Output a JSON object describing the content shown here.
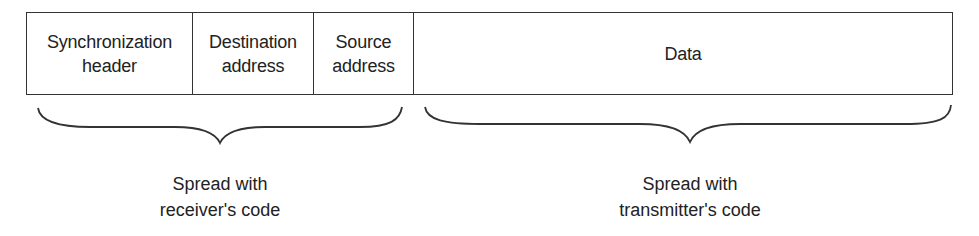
{
  "diagram": {
    "type": "packet-format",
    "fields": [
      {
        "id": "sync",
        "label": "Synchronization\nheader"
      },
      {
        "id": "dest",
        "label": "Destination\naddress"
      },
      {
        "id": "src",
        "label": "Source\naddress"
      },
      {
        "id": "data",
        "label": "Data"
      }
    ],
    "groups": [
      {
        "id": "receiver",
        "spans": [
          "sync",
          "dest",
          "src"
        ],
        "caption": "Spread with\nreceiver's code"
      },
      {
        "id": "transmitter",
        "spans": [
          "data"
        ],
        "caption": "Spread with\ntransmitter's code"
      }
    ],
    "colors": {
      "stroke": "#333333",
      "text": "#222222",
      "background": "#ffffff"
    }
  }
}
